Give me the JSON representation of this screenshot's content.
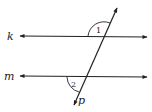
{
  "diagram": {
    "stroke_color": "#222222",
    "lines": [
      {
        "name": "k",
        "label": "k",
        "type": "line-double-arrow"
      },
      {
        "name": "m",
        "label": "m",
        "type": "line-double-arrow"
      },
      {
        "name": "p",
        "label": "p",
        "type": "transversal"
      }
    ],
    "angles": [
      {
        "label": "1",
        "position": "above line k, left of transversal p"
      },
      {
        "label": "2",
        "position": "below line m, left of transversal p"
      }
    ]
  }
}
